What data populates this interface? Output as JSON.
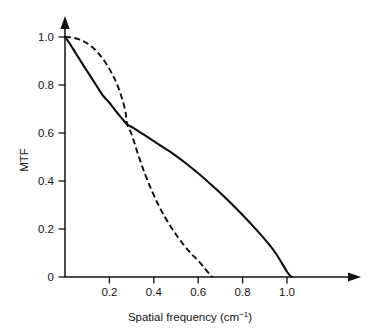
{
  "chart_data": {
    "type": "line",
    "title": "",
    "xlabel": "Spatial frequency (cm⁻¹)",
    "xlabel_base": "Spatial frequency (cm",
    "xlabel_exponent": "−1",
    "xlabel_close": ")",
    "ylabel": "MTF",
    "xlim": [
      0,
      1.16
    ],
    "ylim": [
      0,
      1.04
    ],
    "xticks": [
      0.2,
      0.4,
      0.6,
      0.8,
      1.0
    ],
    "xtick_labels": [
      "0.2",
      "0.4",
      "0.6",
      "0.8",
      "1.0"
    ],
    "yticks": [
      0,
      0.2,
      0.4,
      0.6,
      0.8,
      1.0
    ],
    "ytick_labels": [
      "0",
      "0.2",
      "0.4",
      "0.6",
      "0.8",
      "1.0"
    ],
    "grid": false,
    "legend": false,
    "legend_position": "none",
    "axis_style": "arrow-terminated",
    "annotations": [],
    "series": [
      {
        "name": "solid-mtf",
        "style": "solid",
        "color": "#0d0d0d",
        "x": [
          0.0,
          0.02,
          0.05,
          0.08,
          0.11,
          0.14,
          0.17,
          0.2,
          0.23,
          0.26,
          0.28,
          0.31,
          0.35,
          0.4,
          0.45,
          0.5,
          0.55,
          0.6,
          0.65,
          0.7,
          0.75,
          0.8,
          0.85,
          0.9,
          0.95,
          1.0,
          1.02
        ],
        "y": [
          1.0,
          0.975,
          0.93,
          0.886,
          0.843,
          0.8,
          0.757,
          0.726,
          0.69,
          0.657,
          0.636,
          0.62,
          0.596,
          0.566,
          0.536,
          0.505,
          0.47,
          0.432,
          0.392,
          0.35,
          0.305,
          0.258,
          0.209,
          0.157,
          0.098,
          0.022,
          0.0
        ]
      },
      {
        "name": "dashed-mtf",
        "style": "dashed",
        "color": "#0d0d0d",
        "x": [
          0.0,
          0.03,
          0.06,
          0.09,
          0.12,
          0.15,
          0.18,
          0.21,
          0.24,
          0.27,
          0.28,
          0.3,
          0.33,
          0.36,
          0.39,
          0.42,
          0.45,
          0.48,
          0.51,
          0.54,
          0.57,
          0.6,
          0.63,
          0.655,
          0.665
        ],
        "y": [
          1.0,
          0.998,
          0.991,
          0.979,
          0.96,
          0.933,
          0.897,
          0.85,
          0.79,
          0.7,
          0.636,
          0.595,
          0.508,
          0.43,
          0.362,
          0.302,
          0.25,
          0.205,
          0.164,
          0.128,
          0.096,
          0.068,
          0.035,
          0.008,
          0.0
        ]
      }
    ],
    "crossing_point": {
      "x": 0.28,
      "y": 0.636
    }
  }
}
